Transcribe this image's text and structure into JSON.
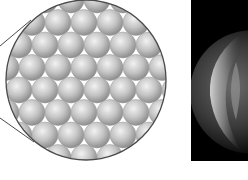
{
  "figure": {
    "colors": {
      "background": "#ffffff",
      "sphere_light": "#e6e6e6",
      "sphere_mid": "#bdbdbd",
      "sphere_dark": "#8e8e8e",
      "outline": "#4a4a4a",
      "panel_bg": "#000000",
      "glow": "#d9d9d9"
    },
    "magnifier": {
      "cx": 86,
      "cy": 80,
      "r": 80
    },
    "packing": {
      "spacing_x": 26,
      "spacing_y": 22.5,
      "sphere_r": 13
    },
    "zoom_lines": [
      {
        "x1": 0,
        "y1": 46,
        "x2": 31,
        "y2": 20
      },
      {
        "x1": 0,
        "y1": 118,
        "x2": 34,
        "y2": 142
      }
    ],
    "micrograph_panel": {
      "x": 191,
      "y": 0,
      "width": 57,
      "height": 161
    },
    "glowing_sphere": {
      "cx": 252,
      "cy": 92,
      "r": 62
    }
  }
}
